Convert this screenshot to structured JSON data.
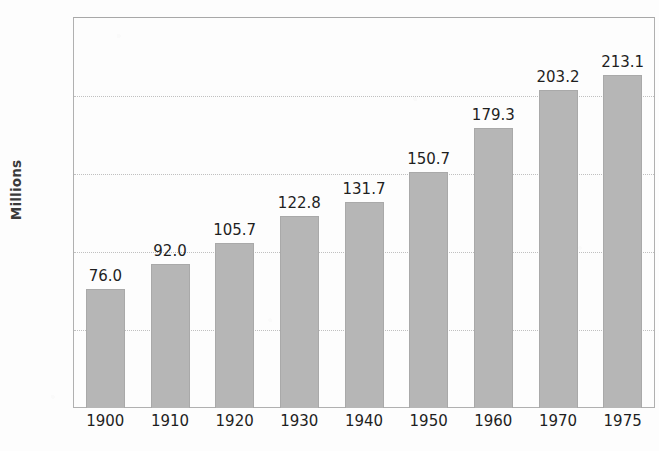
{
  "chart_data": {
    "type": "bar",
    "title": "",
    "xlabel": "",
    "ylabel": "Millions",
    "categories": [
      "1900",
      "1910",
      "1920",
      "1930",
      "1940",
      "1950",
      "1960",
      "1970",
      "1975"
    ],
    "values": [
      76.0,
      92.0,
      105.7,
      122.8,
      131.7,
      150.7,
      179.3,
      203.2,
      213.1
    ],
    "value_labels": [
      "76.0",
      "92.0",
      "105.7",
      "122.8",
      "131.7",
      "150.7",
      "179.3",
      "203.2",
      "213.1"
    ],
    "ylim": [
      0,
      250
    ],
    "xlim_note": "categorical",
    "yticks": [
      0,
      50,
      100,
      150,
      200,
      250
    ],
    "ytick_labels": [
      "0",
      "50",
      "100",
      "150",
      "200",
      "250"
    ],
    "grid": true,
    "grid_axis": "y",
    "legend": false,
    "legend_position": "none",
    "bar_color": "#b6b6b6",
    "bar_border_color": "#a9a9a9",
    "axis_color": "#b0b0b0",
    "gridline_color": "#c4c4c4",
    "text_color": "#1f1f1f",
    "background_color": "#fdfdfd"
  },
  "figure": {
    "cropped_title_fragment": "Population"
  }
}
